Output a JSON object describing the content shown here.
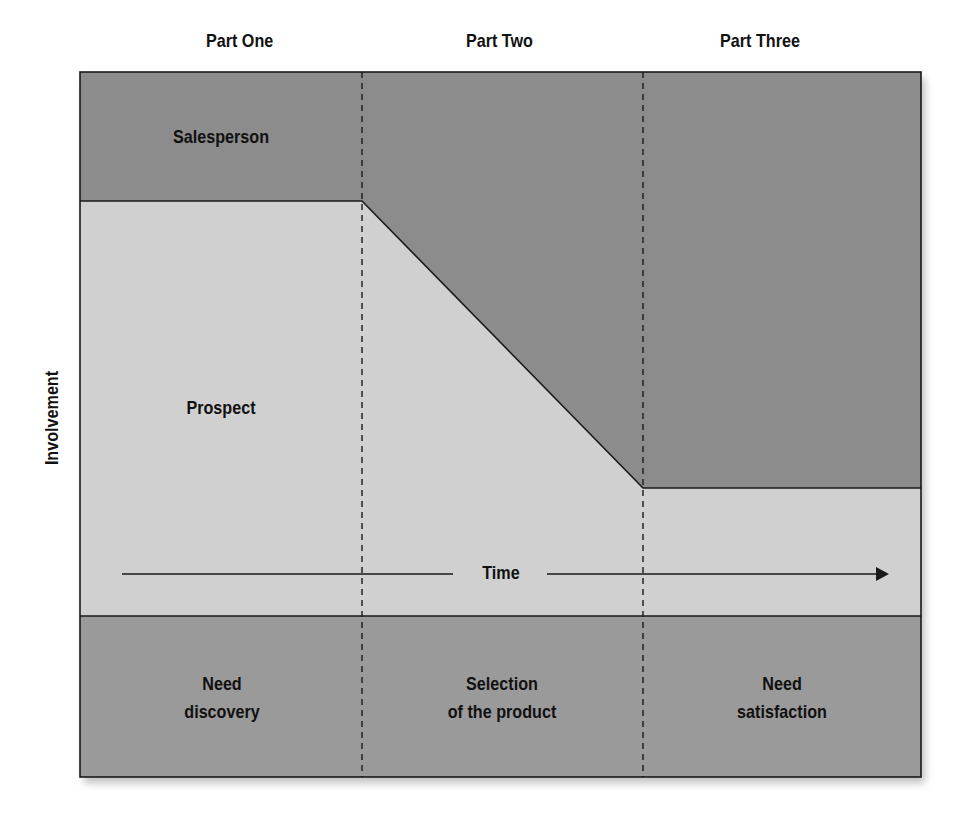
{
  "header": {
    "parts": [
      "Part One",
      "Part Two",
      "Part Three"
    ]
  },
  "axis": {
    "y_label": "Involvement",
    "x_label": "Time"
  },
  "regions": {
    "upper": "Salesperson",
    "lower": "Prospect"
  },
  "phases": [
    {
      "line1": "Need",
      "line2": "discovery"
    },
    {
      "line1": "Selection",
      "line2": "of the product"
    },
    {
      "line1": "Need",
      "line2": "satisfaction"
    }
  ],
  "colors": {
    "salesperson_fill": "#8c8c8c",
    "prospect_fill": "#d0d0d0",
    "phase_band_fill": "#9a9a9a",
    "line": "#1a1a1a"
  }
}
